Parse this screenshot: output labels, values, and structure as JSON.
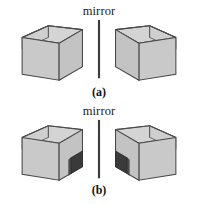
{
  "figure": {
    "background_color": "#ffffff",
    "panels": [
      {
        "id": "a",
        "label": "(a)",
        "mirror_label": "mirror",
        "mirror_line": {
          "color": "#3c3c3c",
          "x": 99,
          "y_top": 20,
          "y_bottom": 80,
          "width_px": 2
        },
        "boxes": [
          {
            "side": "left",
            "orientation": "opening-faces-right",
            "has_dark_patch": false,
            "patch_side": "none"
          },
          {
            "side": "right",
            "orientation": "opening-faces-left",
            "has_dark_patch": false,
            "patch_side": "none"
          }
        ]
      },
      {
        "id": "b",
        "label": "(b)",
        "mirror_label": "mirror",
        "mirror_line": {
          "color": "#3c3c3c",
          "x": 99,
          "y_top": 20,
          "y_bottom": 80,
          "width_px": 2
        },
        "boxes": [
          {
            "side": "left",
            "orientation": "opening-faces-right",
            "has_dark_patch": true,
            "patch_side": "right-face-near-mirror"
          },
          {
            "side": "right",
            "orientation": "opening-faces-left",
            "has_dark_patch": true,
            "patch_side": "left-face-near-mirror"
          }
        ]
      }
    ],
    "colors": {
      "face_front": "#c9c9c9",
      "face_side": "#c2c2c2",
      "face_inner": "#d2d2d2",
      "face_inner_back": "#cdcdcd",
      "rim": "#bfbfbf",
      "outline": "#4a4a4a",
      "patch": "#3a3a3a",
      "patch_edge": "#2a2a2a",
      "patch_side": "#555555",
      "text": "#1b1b1b",
      "mirror_line": "#3c3c3c"
    }
  }
}
